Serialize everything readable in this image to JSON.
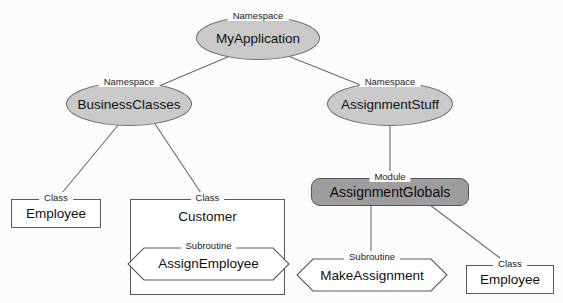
{
  "diagram": {
    "type": "uml-containment-hierarchy",
    "background_color": "#fcfcfc",
    "stereotypes": {
      "namespace": "Namespace",
      "module": "Module",
      "classs": "Class",
      "subroutine": "Subroutine"
    },
    "colors": {
      "namespace_fill": "#c9c9c9",
      "module_fill": "#9d9d9d",
      "class_fill": "#ffffff",
      "subroutine_fill": "#ffffff",
      "stroke": "#5a5a5a",
      "text": "#111111"
    },
    "nodes": [
      {
        "id": "myapplication",
        "name": "MyApplication",
        "stereotype": "Namespace",
        "shape": "ellipse"
      },
      {
        "id": "businessclasses",
        "name": "BusinessClasses",
        "stereotype": "Namespace",
        "shape": "ellipse"
      },
      {
        "id": "assignmentstuff",
        "name": "AssignmentStuff",
        "stereotype": "Namespace",
        "shape": "ellipse"
      },
      {
        "id": "assignmentglobals",
        "name": "AssignmentGlobals",
        "stereotype": "Module",
        "shape": "rounded-rect"
      },
      {
        "id": "employee_left",
        "name": "Employee",
        "stereotype": "Class",
        "shape": "rect"
      },
      {
        "id": "customer",
        "name": "Customer",
        "stereotype": "Class",
        "shape": "rect"
      },
      {
        "id": "assignemployee",
        "name": "AssignEmployee",
        "stereotype": "Subroutine",
        "shape": "hexagon"
      },
      {
        "id": "makeassignment",
        "name": "MakeAssignment",
        "stereotype": "Subroutine",
        "shape": "hexagon"
      },
      {
        "id": "employee_right",
        "name": "Employee",
        "stereotype": "Class",
        "shape": "rect"
      }
    ],
    "edges": [
      {
        "from": "myapplication",
        "to": "businessclasses"
      },
      {
        "from": "myapplication",
        "to": "assignmentstuff"
      },
      {
        "from": "businessclasses",
        "to": "employee_left"
      },
      {
        "from": "businessclasses",
        "to": "customer"
      },
      {
        "from": "assignmentstuff",
        "to": "assignmentglobals"
      },
      {
        "from": "assignmentglobals",
        "to": "makeassignment"
      },
      {
        "from": "assignmentglobals",
        "to": "employee_right"
      }
    ],
    "containment": [
      {
        "parent": "customer",
        "child": "assignemployee"
      }
    ]
  }
}
